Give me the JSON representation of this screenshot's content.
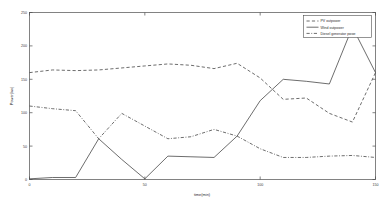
{
  "chart_data": {
    "type": "line",
    "title": "",
    "xlabel": "time(min)",
    "ylabel": "Power(kw)",
    "xlim": [
      0,
      150
    ],
    "ylim": [
      0,
      250
    ],
    "xticks": [
      0,
      50,
      100,
      150
    ],
    "xticklabels": [
      "0",
      "50",
      "100",
      "150"
    ],
    "yticks": [
      0,
      50,
      100,
      150,
      200,
      250
    ],
    "yticklabels": [
      "0",
      "50",
      "100",
      "150",
      "200",
      "250"
    ],
    "grid": false,
    "legend_position": "upper right",
    "x": [
      0,
      10,
      20,
      30,
      40,
      50,
      60,
      70,
      80,
      90,
      100,
      110,
      120,
      130,
      140,
      150
    ],
    "series": [
      {
        "name": "PV outpower",
        "style": "dashed",
        "color": "#3c3c3c",
        "values": [
          160,
          164,
          163,
          164,
          167,
          170,
          173,
          171,
          166,
          174,
          152,
          120,
          122,
          99,
          86,
          160
        ]
      },
      {
        "name": "Wind outpower",
        "style": "solid",
        "color": "#3c3c3c",
        "values": [
          1,
          3,
          3,
          61,
          30,
          1,
          35,
          34,
          33,
          65,
          118,
          150,
          147,
          143,
          228,
          160
        ]
      },
      {
        "name": "Diesel generator  pwoe",
        "style": "dashdot",
        "color": "#3c3c3c",
        "values": [
          110,
          106,
          103,
          61,
          99,
          80,
          61,
          64,
          75,
          65,
          46,
          33,
          33,
          35,
          36,
          33
        ]
      }
    ],
    "legend_entries": [
      "PV outpower",
      "Wind outpower",
      "Diesel generator  pwoe"
    ]
  }
}
